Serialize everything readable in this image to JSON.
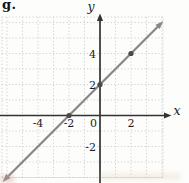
{
  "figure": {
    "label": "g."
  },
  "chart_data": {
    "type": "line",
    "title": "g.",
    "xlabel": "x",
    "ylabel": "y",
    "equation": "y = x + 2",
    "slope": 1,
    "intercept": 2,
    "line_endpoints": [
      [
        -6.1,
        -4.1
      ],
      [
        3.9,
        5.9
      ]
    ],
    "marked_points": [
      [
        -2,
        0
      ],
      [
        0,
        2
      ],
      [
        2,
        4
      ]
    ],
    "x_tick_labels": [
      -4,
      -2,
      0,
      2
    ],
    "y_tick_labels": [
      4,
      2,
      -2
    ],
    "grid": true,
    "grid_x_range": [
      -6,
      4
    ],
    "grid_y_range": [
      -4,
      6
    ],
    "xlim": [
      -6.3,
      4.2
    ],
    "ylim": [
      -4.1,
      6.35
    ],
    "legend": "none",
    "colors": {
      "line": "#878787",
      "axis": "#333333",
      "grid_dots": "#c6c6c6",
      "points": "#4a4a4a",
      "text": "#1c1c1c"
    }
  }
}
